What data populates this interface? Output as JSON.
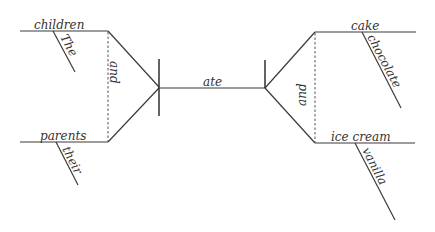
{
  "diagram": {
    "type": "sentence-diagram",
    "sentence_words": {
      "subject_top": "children",
      "subject_top_modifier": "The",
      "subject_conjunction": "and",
      "subject_bottom": "parents",
      "subject_bottom_modifier": "their",
      "verb": "ate",
      "object_conjunction": "and",
      "object_top": "cake",
      "object_top_modifier": "chocolate",
      "object_bottom": "ice cream",
      "object_bottom_modifier": "vanilla"
    },
    "colors": {
      "line": "#3a3a3a",
      "text": "#333333",
      "background": "#ffffff"
    }
  }
}
